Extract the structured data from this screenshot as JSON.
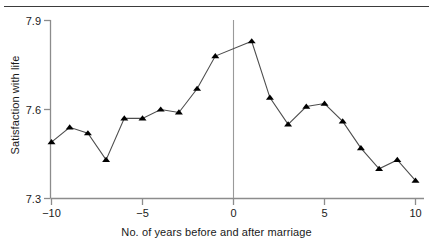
{
  "chart_data": {
    "type": "line",
    "title": "",
    "subtitle": "",
    "xlabel": "No. of years before and after marriage",
    "ylabel": "Satisfaction with life",
    "xlim": [
      -10.6,
      10.6
    ],
    "ylim": [
      7.3,
      7.9
    ],
    "xticks": [
      -10,
      -5,
      0,
      5,
      10
    ],
    "xtick_labels": [
      "−10",
      "−5",
      "0",
      "5",
      "10"
    ],
    "yticks": [
      7.3,
      7.6,
      7.9
    ],
    "ytick_labels": [
      "7.3",
      "7.6",
      "7.9"
    ],
    "grid": false,
    "legend": null,
    "marker": "triangle-up",
    "marker_color": "#000000",
    "line_color": "#4d4d4d",
    "axis_color": "#8c8c8c",
    "reference_line": {
      "x": 0,
      "orientation": "vertical",
      "color": "#9a9a9a",
      "label": ""
    },
    "x": [
      -10,
      -9,
      -8,
      -7,
      -6,
      -5,
      -4,
      -3,
      -2,
      -1,
      1,
      2,
      3,
      4,
      5,
      6,
      7,
      8,
      9,
      10
    ],
    "values": [
      7.49,
      7.54,
      7.52,
      7.43,
      7.57,
      7.57,
      7.6,
      7.59,
      7.67,
      7.78,
      7.83,
      7.64,
      7.55,
      7.61,
      7.62,
      7.56,
      7.47,
      7.4,
      7.43,
      7.36
    ],
    "series": [
      {
        "name": "Satisfaction with life",
        "x": [
          -10,
          -9,
          -8,
          -7,
          -6,
          -5,
          -4,
          -3,
          -2,
          -1,
          1,
          2,
          3,
          4,
          5,
          6,
          7,
          8,
          9,
          10
        ],
        "values": [
          7.49,
          7.54,
          7.52,
          7.43,
          7.57,
          7.57,
          7.6,
          7.59,
          7.67,
          7.78,
          7.83,
          7.64,
          7.55,
          7.61,
          7.62,
          7.56,
          7.47,
          7.4,
          7.43,
          7.36
        ]
      }
    ]
  },
  "axes": {
    "y_top_label": "7.9",
    "y_mid_label": "7.6",
    "y_bottom_label": "7.3",
    "x_labels": [
      "−10",
      "−5",
      "0",
      "5",
      "10"
    ],
    "x_title": "No. of years before and after marriage",
    "y_title": "Satisfaction with life"
  }
}
